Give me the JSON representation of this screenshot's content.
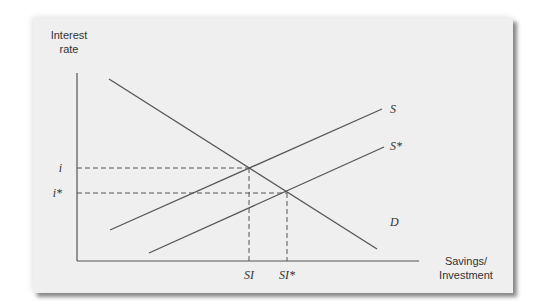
{
  "chart_data": {
    "type": "line",
    "title": "",
    "ylabel": "Interest rate",
    "xlabel": "Savings/ Investment",
    "ylabel_lines": [
      "Interest",
      "rate"
    ],
    "xlabel_lines": [
      "Savings/",
      "Investment"
    ],
    "grid": false,
    "series": [
      {
        "name": "S",
        "label": "S",
        "points": [
          [
            110,
            230
          ],
          [
            382,
            109
          ]
        ]
      },
      {
        "name": "S*",
        "label": "S*",
        "points": [
          [
            149,
            253
          ],
          [
            384,
            147
          ]
        ]
      },
      {
        "name": "D",
        "label": "D",
        "points": [
          [
            109,
            79
          ],
          [
            377,
            249
          ]
        ]
      }
    ],
    "equilibria": [
      {
        "rate_label": "i",
        "quantity_label": "SI",
        "point": [
          249,
          168
        ]
      },
      {
        "rate_label": "i*",
        "quantity_label": "SI*",
        "point": [
          287,
          193
        ]
      }
    ],
    "y_ticks": [
      "i",
      "i*"
    ],
    "x_ticks": [
      "SI",
      "SI*"
    ],
    "axis": {
      "origin": [
        77,
        261
      ],
      "y_top": 73,
      "x_right": 419
    }
  },
  "colors": {
    "line": "#555555",
    "panel": "#efefef",
    "text": "#333333"
  }
}
